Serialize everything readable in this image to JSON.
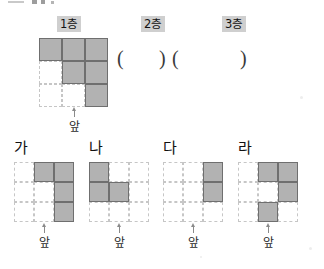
{
  "page": {
    "type": "math-worksheet-question",
    "fill_color": "#b2b2b2",
    "fill_border_color": "#6f6f6f",
    "empty_border_color": "#c6c6c6",
    "label_highlight_color": "#cfcfcf"
  },
  "top_section": {
    "floor_labels": [
      {
        "text": "1층"
      },
      {
        "text": "2층"
      },
      {
        "text": "3층"
      }
    ],
    "answer_blanks": [
      {
        "open": "(",
        "close": ")",
        "value": ""
      },
      {
        "open": "(",
        "close": ")",
        "value": ""
      }
    ],
    "grid": {
      "rows": 3,
      "cols": 3,
      "cells": [
        [
          1,
          1,
          1
        ],
        [
          0,
          1,
          1
        ],
        [
          0,
          0,
          1
        ]
      ]
    },
    "front_label": "앞"
  },
  "options": [
    {
      "letter": "가",
      "front_label": "앞",
      "grid": {
        "rows": 3,
        "cols": 3,
        "cells": [
          [
            0,
            1,
            1
          ],
          [
            0,
            0,
            1
          ],
          [
            0,
            0,
            1
          ]
        ]
      }
    },
    {
      "letter": "나",
      "front_label": "앞",
      "grid": {
        "rows": 3,
        "cols": 3,
        "cells": [
          [
            1,
            0,
            0
          ],
          [
            1,
            1,
            0
          ],
          [
            0,
            0,
            0
          ]
        ]
      }
    },
    {
      "letter": "다",
      "front_label": "앞",
      "grid": {
        "rows": 3,
        "cols": 3,
        "cells": [
          [
            0,
            0,
            1
          ],
          [
            0,
            0,
            1
          ],
          [
            0,
            0,
            0
          ]
        ]
      }
    },
    {
      "letter": "라",
      "front_label": "앞",
      "grid": {
        "rows": 3,
        "cols": 3,
        "cells": [
          [
            0,
            1,
            1
          ],
          [
            0,
            0,
            1
          ],
          [
            0,
            1,
            0
          ]
        ]
      }
    }
  ]
}
